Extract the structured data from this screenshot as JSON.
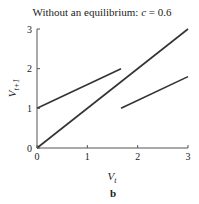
{
  "chart_data": {
    "type": "line",
    "title_prefix": "Without an equilibrium: ",
    "title_var": "c",
    "title_suffix": " = 0.6",
    "xlabel_main": "V",
    "xlabel_sub": "t",
    "ylabel_main": "V",
    "ylabel_sub": "t+1",
    "panel_label": "b",
    "xlim": [
      0,
      3
    ],
    "ylim": [
      0,
      3
    ],
    "x_ticks": [
      0,
      1,
      2,
      3
    ],
    "y_ticks": [
      0,
      1,
      2,
      3
    ],
    "x_tick_labels": [
      "0",
      "1",
      "2",
      "3"
    ],
    "y_tick_labels": [
      "0",
      "1",
      "2",
      "3"
    ],
    "grid": false,
    "series": [
      {
        "name": "45-degree line",
        "x": [
          0,
          3
        ],
        "y": [
          0,
          3
        ]
      },
      {
        "name": "upper branch",
        "x": [
          0,
          1.67
        ],
        "y": [
          1,
          2
        ]
      },
      {
        "name": "lower branch",
        "x": [
          1.67,
          3
        ],
        "y": [
          1,
          1.8
        ]
      }
    ],
    "line_color": "#333333"
  }
}
